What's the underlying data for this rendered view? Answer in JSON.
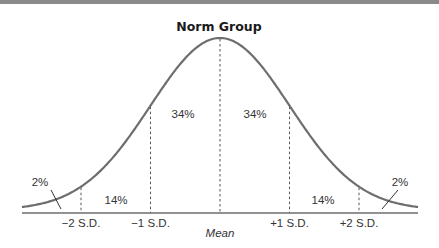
{
  "chart_data": {
    "type": "line",
    "title": "Norm Group",
    "distribution": "normal",
    "x_ticks": [
      {
        "sd": -2,
        "label": "−2 S.D."
      },
      {
        "sd": -1,
        "label": "−1 S.D."
      },
      {
        "sd": 0,
        "label": "Mean"
      },
      {
        "sd": 1,
        "label": "+1 S.D."
      },
      {
        "sd": 2,
        "label": "+2 S.D."
      }
    ],
    "regions": [
      {
        "from_sd": -3,
        "to_sd": -2,
        "percent": "2%"
      },
      {
        "from_sd": -2,
        "to_sd": -1,
        "percent": "14%"
      },
      {
        "from_sd": -1,
        "to_sd": 0,
        "percent": "34%"
      },
      {
        "from_sd": 0,
        "to_sd": 1,
        "percent": "34%"
      },
      {
        "from_sd": 1,
        "to_sd": 2,
        "percent": "14%"
      },
      {
        "from_sd": 2,
        "to_sd": 3,
        "percent": "2%"
      }
    ],
    "x_range_sd": [
      -2.85,
      2.85
    ],
    "colors": {
      "curve": "#6e6e6e",
      "axis": "#6e6e6e",
      "divider": "#555555",
      "text": "#333333"
    }
  }
}
